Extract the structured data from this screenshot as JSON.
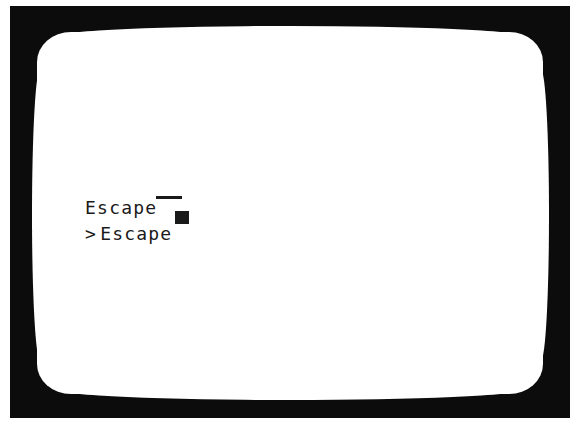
{
  "terminal": {
    "lines": [
      {
        "text": "Escape",
        "cursor": "underscore"
      },
      {
        "prompt": ">",
        "text": "Escape",
        "cursor": "block"
      }
    ]
  },
  "colors": {
    "bezel": "#0c0c0c",
    "screen": "#ffffff",
    "text": "#1a1a1a"
  }
}
